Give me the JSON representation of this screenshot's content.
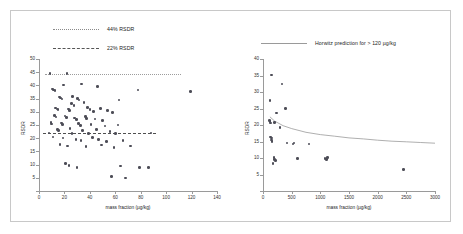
{
  "figure": {
    "background": "#ffffff",
    "border_color": "#c8c8c8",
    "point_color": "#4d4d57"
  },
  "chart_data": [
    {
      "type": "scatter",
      "panel": "left",
      "title": "",
      "xlabel": "mass fraction (µg/kg)",
      "ylabel": "RSDR",
      "xlim": [
        0,
        140
      ],
      "ylim": [
        0,
        50
      ],
      "xticks": [
        0,
        20,
        40,
        60,
        80,
        100,
        120,
        140
      ],
      "yticks": [
        0,
        5,
        10,
        15,
        20,
        25,
        30,
        35,
        40,
        45,
        50
      ],
      "grid": false,
      "legend_position": "top-left",
      "legend": [
        {
          "label": "44% RSDR",
          "style": "dotted",
          "color": "#9c9c9c"
        },
        {
          "label": "22% RSDR",
          "style": "dashed",
          "color": "#4f4f4f"
        }
      ],
      "reference_lines": [
        {
          "name": "44% RSDR",
          "y": 44.5,
          "style": "dotted",
          "x_start": 5,
          "x_end": 112
        },
        {
          "name": "22% RSDR",
          "y": 21.8,
          "style": "dashed",
          "x_start": 3,
          "x_end": 92
        }
      ],
      "points": [
        [
          8.5,
          44.6
        ],
        [
          22.0,
          44.6
        ],
        [
          10.5,
          38.6
        ],
        [
          11.5,
          38.3
        ],
        [
          12.5,
          38.1
        ],
        [
          19.5,
          40.2
        ],
        [
          33.5,
          40.5
        ],
        [
          46.0,
          39.6
        ],
        [
          78.0,
          38.2
        ],
        [
          119.0,
          37.6
        ],
        [
          16.0,
          35.6
        ],
        [
          17.0,
          35.2
        ],
        [
          18.0,
          34.9
        ],
        [
          26.5,
          35.8
        ],
        [
          30.5,
          35.0
        ],
        [
          31.5,
          34.5
        ],
        [
          25.5,
          33.2
        ],
        [
          27.5,
          32.4
        ],
        [
          35.5,
          33.6
        ],
        [
          63.0,
          34.5
        ],
        [
          13.0,
          31.4
        ],
        [
          14.0,
          31.1
        ],
        [
          15.0,
          30.8
        ],
        [
          23.0,
          31.0
        ],
        [
          24.0,
          30.4
        ],
        [
          38.0,
          31.6
        ],
        [
          40.0,
          30.9
        ],
        [
          43.0,
          30.2
        ],
        [
          48.5,
          31.2
        ],
        [
          54.0,
          30.4
        ],
        [
          58.0,
          29.8
        ],
        [
          12.0,
          28.6
        ],
        [
          13.5,
          28.1
        ],
        [
          20.5,
          28.4
        ],
        [
          21.5,
          27.8
        ],
        [
          28.0,
          27.6
        ],
        [
          29.5,
          27.1
        ],
        [
          36.5,
          28.2
        ],
        [
          37.5,
          27.5
        ],
        [
          44.0,
          27.2
        ],
        [
          50.0,
          26.6
        ],
        [
          9.5,
          26.0
        ],
        [
          10.0,
          25.4
        ],
        [
          17.5,
          25.8
        ],
        [
          18.5,
          25.2
        ],
        [
          31.0,
          25.6
        ],
        [
          32.5,
          24.9
        ],
        [
          41.0,
          25.1
        ],
        [
          52.0,
          24.6
        ],
        [
          62.0,
          25.0
        ],
        [
          14.5,
          23.4
        ],
        [
          15.5,
          22.9
        ],
        [
          24.5,
          23.6
        ],
        [
          34.0,
          23.0
        ],
        [
          45.0,
          23.2
        ],
        [
          56.0,
          22.6
        ],
        [
          8.0,
          21.9
        ],
        [
          26.0,
          21.8
        ],
        [
          39.0,
          21.7
        ],
        [
          60.0,
          21.8
        ],
        [
          88.0,
          21.9
        ],
        [
          11.0,
          20.4
        ],
        [
          19.0,
          20.0
        ],
        [
          29.0,
          19.6
        ],
        [
          33.0,
          19.2
        ],
        [
          42.0,
          20.2
        ],
        [
          47.0,
          19.4
        ],
        [
          53.0,
          18.8
        ],
        [
          66.0,
          19.2
        ],
        [
          16.5,
          17.6
        ],
        [
          22.5,
          17.1
        ],
        [
          37.0,
          16.8
        ],
        [
          49.0,
          17.4
        ],
        [
          59.0,
          16.4
        ],
        [
          72.0,
          17.0
        ],
        [
          21.0,
          10.4
        ],
        [
          23.5,
          9.6
        ],
        [
          30.0,
          9.0
        ],
        [
          64.0,
          9.4
        ],
        [
          79.0,
          9.0
        ],
        [
          86.0,
          8.8
        ],
        [
          57.0,
          5.6
        ],
        [
          68.0,
          5.0
        ]
      ]
    },
    {
      "type": "scatter",
      "panel": "right",
      "title": "",
      "xlabel": "mass fraction (µg/kg)",
      "ylabel": "RSDR",
      "xlim": [
        0,
        3000
      ],
      "ylim": [
        0,
        40
      ],
      "xticks": [
        0,
        500,
        1000,
        1500,
        2000,
        2500,
        3000
      ],
      "yticks": [
        0,
        5,
        10,
        15,
        20,
        25,
        30,
        35,
        40
      ],
      "grid": false,
      "legend_position": "top-left",
      "legend": [
        {
          "label": "Horwitz prediction for > 120 µg/kg",
          "style": "solid",
          "color": "#9a9a9a"
        }
      ],
      "horwitz_curve": {
        "name": "Horwitz prediction for > 120 µg/kg",
        "points": [
          [
            120,
            22.5
          ],
          [
            200,
            21.2
          ],
          [
            350,
            19.8
          ],
          [
            500,
            18.9
          ],
          [
            750,
            17.8
          ],
          [
            1000,
            17.1
          ],
          [
            1250,
            16.6
          ],
          [
            1500,
            16.1
          ],
          [
            1750,
            15.8
          ],
          [
            2000,
            15.4
          ],
          [
            2250,
            15.1
          ],
          [
            2500,
            14.9
          ],
          [
            2750,
            14.7
          ],
          [
            3000,
            14.5
          ]
        ]
      },
      "points": [
        [
          150,
          35.2
        ],
        [
          330,
          32.4
        ],
        [
          120,
          27.4
        ],
        [
          390,
          25.0
        ],
        [
          240,
          23.6
        ],
        [
          110,
          21.3
        ],
        [
          125,
          21.0
        ],
        [
          130,
          20.6
        ],
        [
          205,
          20.8
        ],
        [
          300,
          19.2
        ],
        [
          135,
          16.4
        ],
        [
          145,
          16.0
        ],
        [
          150,
          15.4
        ],
        [
          160,
          15.0
        ],
        [
          420,
          14.6
        ],
        [
          520,
          14.2
        ],
        [
          540,
          14.6
        ],
        [
          800,
          14.2
        ],
        [
          195,
          10.2
        ],
        [
          205,
          9.6
        ],
        [
          215,
          9.3
        ],
        [
          175,
          8.4
        ],
        [
          600,
          9.8
        ],
        [
          1080,
          9.8
        ],
        [
          1110,
          9.6
        ],
        [
          1120,
          10.1
        ],
        [
          2450,
          6.6
        ]
      ]
    }
  ]
}
